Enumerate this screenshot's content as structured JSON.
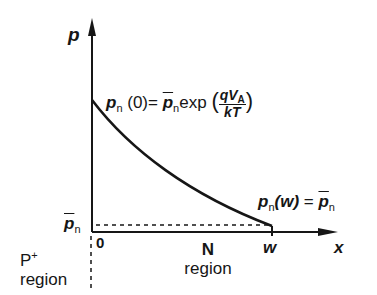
{
  "diagram": {
    "axes": {
      "y_label": "p",
      "x_label": "x",
      "origin_label": "0",
      "w_label": "w"
    },
    "y_marker": {
      "symbol": "p",
      "subscript": "n",
      "overbar": true
    },
    "top_equation": {
      "lhs_symbol": "p",
      "lhs_subscript": "n",
      "lhs_arg": "(0)",
      "equals": "=",
      "rhs_symbol": "p",
      "rhs_subscript": "n",
      "rhs_overbar": true,
      "func": "exp",
      "open_paren": "(",
      "frac_num": "qV",
      "frac_num_sub": "A",
      "frac_den": "kT",
      "close_paren": ")"
    },
    "bottom_equation": {
      "lhs_symbol": "p",
      "lhs_subscript": "n",
      "lhs_arg": "(w)",
      "equals": "=",
      "rhs_symbol": "p",
      "rhs_subscript": "n",
      "rhs_overbar": true
    },
    "regions": [
      {
        "name": "P",
        "superscript": "+",
        "suffix": "region"
      },
      {
        "name": "N",
        "superscript": "",
        "suffix": "region"
      }
    ],
    "curve": {
      "type": "exponential-decay",
      "start": "p_n(0)",
      "end": "p_n(w) = equilibrium p_n"
    },
    "colors": {
      "ink": "#161616",
      "background": "#ffffff"
    }
  }
}
